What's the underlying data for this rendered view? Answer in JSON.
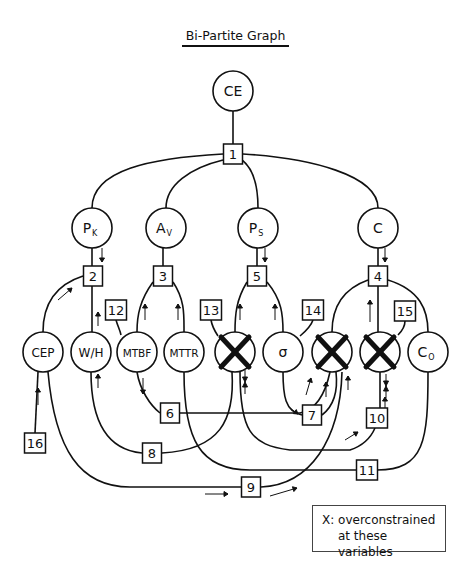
{
  "title": "Bi-Partite Graph",
  "legend": {
    "line1": "X: overconstrained",
    "line2": "at these variables"
  },
  "variables": [
    {
      "id": "CE",
      "label": "CE",
      "x": 233,
      "y": 91,
      "crossed": false
    },
    {
      "id": "Pk",
      "label": "P",
      "sub": "K",
      "x": 92,
      "y": 228,
      "crossed": false
    },
    {
      "id": "Av",
      "label": "A",
      "sub": "V",
      "x": 166,
      "y": 228,
      "crossed": false
    },
    {
      "id": "Ps",
      "label": "P",
      "sub": "S",
      "x": 258,
      "y": 228,
      "crossed": false
    },
    {
      "id": "C",
      "label": "C",
      "x": 378,
      "y": 228,
      "crossed": false
    },
    {
      "id": "CEP",
      "label": "CEP",
      "x": 43,
      "y": 352,
      "crossed": false
    },
    {
      "id": "WH",
      "label": "W/H",
      "x": 91,
      "y": 352,
      "crossed": false
    },
    {
      "id": "MTBF",
      "label": "MTBF",
      "x": 137,
      "y": 352,
      "crossed": false
    },
    {
      "id": "MTTR",
      "label": "MTTR",
      "x": 184,
      "y": 352,
      "crossed": false
    },
    {
      "id": "X1",
      "label": "",
      "x": 235,
      "y": 352,
      "crossed": true
    },
    {
      "id": "sigma",
      "label": "σ",
      "x": 283,
      "y": 352,
      "crossed": false
    },
    {
      "id": "X2",
      "label": "",
      "x": 332,
      "y": 352,
      "crossed": true
    },
    {
      "id": "X3",
      "label": "",
      "x": 380,
      "y": 352,
      "crossed": true
    },
    {
      "id": "Co",
      "label": "C",
      "sub": "O",
      "x": 428,
      "y": 352,
      "crossed": false
    }
  ],
  "constraints": [
    {
      "id": "1",
      "x": 233,
      "y": 154
    },
    {
      "id": "2",
      "x": 93,
      "y": 276
    },
    {
      "id": "3",
      "x": 163,
      "y": 276
    },
    {
      "id": "5",
      "x": 257,
      "y": 276
    },
    {
      "id": "4",
      "x": 378,
      "y": 276
    },
    {
      "id": "12",
      "x": 116,
      "y": 310
    },
    {
      "id": "13",
      "x": 211,
      "y": 310
    },
    {
      "id": "14",
      "x": 313,
      "y": 310
    },
    {
      "id": "15",
      "x": 405,
      "y": 311
    },
    {
      "id": "6",
      "x": 170,
      "y": 413
    },
    {
      "id": "7",
      "x": 312,
      "y": 415
    },
    {
      "id": "10",
      "x": 377,
      "y": 418
    },
    {
      "id": "16",
      "x": 35,
      "y": 443
    },
    {
      "id": "8",
      "x": 152,
      "y": 453
    },
    {
      "id": "11",
      "x": 367,
      "y": 470
    },
    {
      "id": "9",
      "x": 251,
      "y": 487
    }
  ],
  "edges": [
    "M233 111 L233 144",
    "M223 154 C 150 158, 92 170, 92 208",
    "M223 160 C 190 168, 166 185, 166 208",
    "M242 160 C 255 170, 258 190, 258 208",
    "M243 154 C 310 158, 378 175, 378 208",
    "M92 248 L92 266",
    "M163 248 L163 266",
    "M257 248 L257 266",
    "M378 248 L378 266",
    "M83 276 C 55 285, 43 305, 43 332",
    "M92 286 L92 332",
    "M153 282 C 140 300, 137 315, 137 332",
    "M173 282 C 185 300, 184 315, 184 332",
    "M247 282 C 236 300, 235 315, 235 332",
    "M267 282 C 282 300, 283 315, 283 332",
    "M368 280 C 340 290, 332 310, 332 332",
    "M378 286 L378 332",
    "M388 280 C 420 290, 428 310, 428 332",
    "M116 320 C 118 327, 120 330, 121 335",
    "M211 320 C 212 326, 214 330, 218 336",
    "M313 320 C 311 326, 306 331, 300 336",
    "M405 321 C 405 326, 403 330, 398 335",
    "M137 372 C 140 390, 150 405, 160 413",
    "M180 413 L 300 413 C 315 410, 325 395, 330 372",
    "M283 372 C 283 395, 285 412, 302 415",
    "M322 415 C 335 405, 338 390, 336 372",
    "M380 372 L380 408",
    "M35 433 L 38 372",
    "M91 372 C 91 425, 110 450, 142 453",
    "M162 453 C 220 450, 235 420, 232 372",
    "M240 372 C 240 430, 250 445, 290 450 L 350 450 C 365 445, 372 435, 375 428",
    "M184 372 C 184 440, 200 470, 250 470 L 357 470",
    "M377 470 C 425 470, 428 440, 428 372",
    "M48 372 C 55 450, 80 487, 130 487 L 241 487",
    "M261 487 C 310 485, 340 440, 342 372"
  ],
  "arrows": [
    {
      "x1": 102,
      "y1": 248,
      "x2": 102,
      "y2": 262
    },
    {
      "x1": 265,
      "y1": 248,
      "x2": 265,
      "y2": 262
    },
    {
      "x1": 385,
      "y1": 248,
      "x2": 385,
      "y2": 262
    },
    {
      "x1": 58,
      "y1": 300,
      "x2": 72,
      "y2": 288
    },
    {
      "x1": 98,
      "y1": 326,
      "x2": 98,
      "y2": 312
    },
    {
      "x1": 145,
      "y1": 320,
      "x2": 145,
      "y2": 304
    },
    {
      "x1": 178,
      "y1": 320,
      "x2": 178,
      "y2": 304
    },
    {
      "x1": 240,
      "y1": 320,
      "x2": 240,
      "y2": 304
    },
    {
      "x1": 275,
      "y1": 320,
      "x2": 275,
      "y2": 304
    },
    {
      "x1": 370,
      "y1": 322,
      "x2": 370,
      "y2": 300
    },
    {
      "x1": 98,
      "y1": 388,
      "x2": 98,
      "y2": 374
    },
    {
      "x1": 143,
      "y1": 378,
      "x2": 143,
      "y2": 394
    },
    {
      "x1": 38,
      "y1": 405,
      "x2": 38,
      "y2": 388
    },
    {
      "x1": 306,
      "y1": 395,
      "x2": 311,
      "y2": 378
    },
    {
      "x1": 326,
      "y1": 397,
      "x2": 326,
      "y2": 382
    },
    {
      "x1": 348,
      "y1": 390,
      "x2": 348,
      "y2": 376
    },
    {
      "x1": 290,
      "y1": 408,
      "x2": 298,
      "y2": 414
    },
    {
      "x1": 345,
      "y1": 440,
      "x2": 358,
      "y2": 432
    },
    {
      "x1": 385,
      "y1": 410,
      "x2": 385,
      "y2": 397
    },
    {
      "x1": 205,
      "y1": 494,
      "x2": 228,
      "y2": 494
    },
    {
      "x1": 270,
      "y1": 496,
      "x2": 297,
      "y2": 488
    }
  ],
  "bowties": [
    {
      "x": 245,
      "y": 382
    },
    {
      "x": 386,
      "y": 386
    }
  ]
}
